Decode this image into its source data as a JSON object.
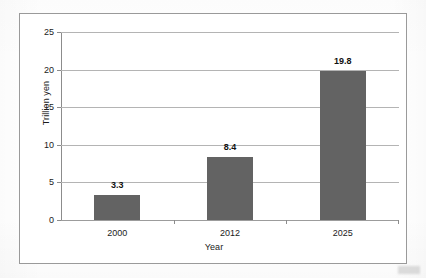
{
  "chart_data": {
    "type": "bar",
    "title": "",
    "categories": [
      "2000",
      "2012",
      "2025"
    ],
    "values": [
      3.3,
      8.4,
      19.8
    ],
    "value_labels": [
      "3.3",
      "8.4",
      "19.8"
    ],
    "xlabel": "Year",
    "ylabel": "Trillion yen",
    "ylim": [
      0,
      25
    ],
    "ytick_labels": [
      "0",
      "5",
      "10",
      "15",
      "20",
      "25"
    ],
    "ytick_values": [
      0,
      5,
      10,
      15,
      20,
      25
    ],
    "grid": true,
    "legend": "none",
    "series": [
      {
        "name": "Trillion yen",
        "values": [
          3.3,
          8.4,
          19.8
        ]
      }
    ],
    "colors": {
      "bar_fill": "#636363",
      "gridline": "#b4b4b4",
      "axis_line": "#8c8c8c",
      "frame_border": "#9a9a9a",
      "plot_background": "#ffffff",
      "text": "#1b1b1b"
    }
  }
}
